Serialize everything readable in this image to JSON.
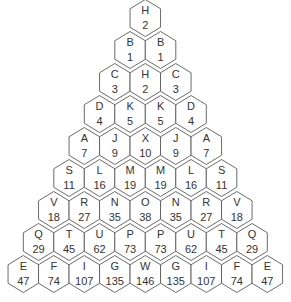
{
  "diagram": {
    "type": "hexagon-pyramid",
    "rows": [
      [
        {
          "letter": "H",
          "number": "2"
        }
      ],
      [
        {
          "letter": "B",
          "number": "1"
        },
        {
          "letter": "B",
          "number": "1"
        }
      ],
      [
        {
          "letter": "C",
          "number": "3"
        },
        {
          "letter": "H",
          "number": "2"
        },
        {
          "letter": "C",
          "number": "3"
        }
      ],
      [
        {
          "letter": "D",
          "number": "4"
        },
        {
          "letter": "K",
          "number": "5"
        },
        {
          "letter": "K",
          "number": "5"
        },
        {
          "letter": "D",
          "number": "4"
        }
      ],
      [
        {
          "letter": "A",
          "number": "7"
        },
        {
          "letter": "J",
          "number": "9"
        },
        {
          "letter": "X",
          "number": "10"
        },
        {
          "letter": "J",
          "number": "9"
        },
        {
          "letter": "A",
          "number": "7"
        }
      ],
      [
        {
          "letter": "S",
          "number": "11"
        },
        {
          "letter": "L",
          "number": "16"
        },
        {
          "letter": "M",
          "number": "19"
        },
        {
          "letter": "M",
          "number": "19"
        },
        {
          "letter": "L",
          "number": "16"
        },
        {
          "letter": "S",
          "number": "11"
        }
      ],
      [
        {
          "letter": "V",
          "number": "18"
        },
        {
          "letter": "R",
          "number": "27"
        },
        {
          "letter": "N",
          "number": "35"
        },
        {
          "letter": "O",
          "number": "38"
        },
        {
          "letter": "N",
          "number": "35"
        },
        {
          "letter": "R",
          "number": "27"
        },
        {
          "letter": "V",
          "number": "18"
        }
      ],
      [
        {
          "letter": "Q",
          "number": "29"
        },
        {
          "letter": "T",
          "number": "45"
        },
        {
          "letter": "U",
          "number": "62"
        },
        {
          "letter": "P",
          "number": "73"
        },
        {
          "letter": "P",
          "number": "73"
        },
        {
          "letter": "U",
          "number": "62"
        },
        {
          "letter": "T",
          "number": "45"
        },
        {
          "letter": "Q",
          "number": "29"
        }
      ],
      [
        {
          "letter": "E",
          "number": "47"
        },
        {
          "letter": "F",
          "number": "74"
        },
        {
          "letter": "I",
          "number": "107"
        },
        {
          "letter": "G",
          "number": "135"
        },
        {
          "letter": "W",
          "number": "146"
        },
        {
          "letter": "G",
          "number": "135"
        },
        {
          "letter": "I",
          "number": "107"
        },
        {
          "letter": "F",
          "number": "74"
        },
        {
          "letter": "E",
          "number": "47"
        }
      ]
    ],
    "colors": {
      "stroke": "#5a5a5a",
      "fill": "#ffffff",
      "text": "#333333"
    }
  }
}
